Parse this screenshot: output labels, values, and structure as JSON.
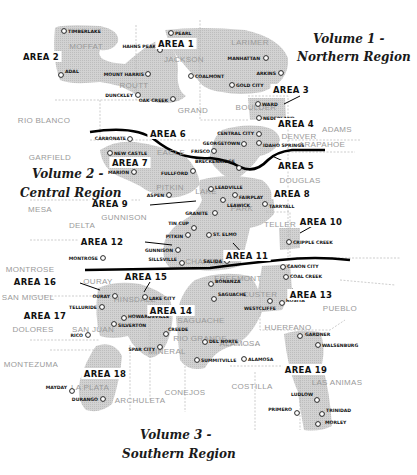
{
  "map": {
    "title": "Colorado Mining Regions",
    "volumes": [
      {
        "id": "v1",
        "line1": "Volume 1 -",
        "line2": "Northern Region",
        "x1": 313,
        "y1": 43,
        "x2": 297,
        "y2": 61,
        "anchor": "start"
      },
      {
        "id": "v2",
        "line1": "Volume 2 -",
        "line2": "Central Region",
        "x1": 32,
        "y1": 178,
        "x2": 20,
        "y2": 197,
        "anchor": "start"
      },
      {
        "id": "v3",
        "line1": "Volume 3 -",
        "line2": "Southern Region",
        "x1": 140,
        "y1": 439,
        "x2": 122,
        "y2": 458,
        "anchor": "start"
      }
    ],
    "areas": [
      {
        "id": "area-1",
        "label": "AREA 1",
        "x": 176,
        "y": 47
      },
      {
        "id": "area-2",
        "label": "AREA 2",
        "x": 41,
        "y": 60
      },
      {
        "id": "area-3",
        "label": "AREA 3",
        "x": 291,
        "y": 93
      },
      {
        "id": "area-4",
        "label": "AREA 4",
        "x": 296,
        "y": 127
      },
      {
        "id": "area-5",
        "label": "AREA 5",
        "x": 296,
        "y": 169
      },
      {
        "id": "area-6",
        "label": "AREA 6",
        "x": 168,
        "y": 137
      },
      {
        "id": "area-7",
        "label": "AREA 7",
        "x": 130,
        "y": 166
      },
      {
        "id": "area-8",
        "label": "AREA 8",
        "x": 292,
        "y": 197
      },
      {
        "id": "area-9",
        "label": "AREA 9",
        "x": 110,
        "y": 207
      },
      {
        "id": "area-10",
        "label": "AREA 10",
        "x": 321,
        "y": 225
      },
      {
        "id": "area-11",
        "label": "AREA 11",
        "x": 247,
        "y": 259
      },
      {
        "id": "area-12",
        "label": "AREA 12",
        "x": 102,
        "y": 245
      },
      {
        "id": "area-13",
        "label": "AREA 13",
        "x": 311,
        "y": 298
      },
      {
        "id": "area-14",
        "label": "AREA 14",
        "x": 171,
        "y": 314
      },
      {
        "id": "area-15",
        "label": "AREA 15",
        "x": 146,
        "y": 280
      },
      {
        "id": "area-16",
        "label": "AREA 16",
        "x": 35,
        "y": 285
      },
      {
        "id": "area-17",
        "label": "AREA 17",
        "x": 45,
        "y": 319
      },
      {
        "id": "area-18",
        "label": "AREA 18",
        "x": 105,
        "y": 377
      },
      {
        "id": "area-19",
        "label": "AREA 19",
        "x": 306,
        "y": 373
      }
    ],
    "counties": [
      {
        "name": "MOFFAT",
        "x": 86,
        "y": 49
      },
      {
        "name": "LARIMER",
        "x": 250,
        "y": 45
      },
      {
        "name": "JACKSON",
        "x": 184,
        "y": 62
      },
      {
        "name": "ROUTT",
        "x": 134,
        "y": 88
      },
      {
        "name": "GRAND",
        "x": 193,
        "y": 113
      },
      {
        "name": "RIO BLANCO",
        "x": 44,
        "y": 123
      },
      {
        "name": "BOULDER",
        "x": 256,
        "y": 110
      },
      {
        "name": "ADAMS",
        "x": 337,
        "y": 132
      },
      {
        "name": "ARAPAHOE",
        "x": 322,
        "y": 147
      },
      {
        "name": "DENVER",
        "x": 299,
        "y": 139
      },
      {
        "name": "GARFIELD",
        "x": 50,
        "y": 160
      },
      {
        "name": "EAGLE",
        "x": 171,
        "y": 155
      },
      {
        "name": "DOUGLAS",
        "x": 300,
        "y": 183
      },
      {
        "name": "PITKIN",
        "x": 170,
        "y": 190
      },
      {
        "name": "LAKE",
        "x": 206,
        "y": 194
      },
      {
        "name": "MESA",
        "x": 40,
        "y": 212
      },
      {
        "name": "PARK",
        "x": 242,
        "y": 211
      },
      {
        "name": "GUNNISON",
        "x": 124,
        "y": 220
      },
      {
        "name": "TELLER",
        "x": 280,
        "y": 227
      },
      {
        "name": "DELTA",
        "x": 82,
        "y": 228
      },
      {
        "name": "CHAFFEE",
        "x": 205,
        "y": 264
      },
      {
        "name": "MONTROSE",
        "x": 30,
        "y": 272
      },
      {
        "name": "FREEMONT",
        "x": 238,
        "y": 281
      },
      {
        "name": "SAN MIGUEL",
        "x": 28,
        "y": 300
      },
      {
        "name": "OURAY",
        "x": 98,
        "y": 284
      },
      {
        "name": "HINSDALE",
        "x": 135,
        "y": 302
      },
      {
        "name": "CUSTER",
        "x": 260,
        "y": 297
      },
      {
        "name": "PUEBLO",
        "x": 340,
        "y": 311
      },
      {
        "name": "SAGUACHE",
        "x": 201,
        "y": 323
      },
      {
        "name": "DOLORES",
        "x": 33,
        "y": 332
      },
      {
        "name": "SAN JUAN",
        "x": 93,
        "y": 332
      },
      {
        "name": "HUERFANO",
        "x": 288,
        "y": 330
      },
      {
        "name": "RIO GRANDE",
        "x": 200,
        "y": 341
      },
      {
        "name": "MINERAL",
        "x": 167,
        "y": 354
      },
      {
        "name": "ALAMOSA",
        "x": 240,
        "y": 346
      },
      {
        "name": "MONTEZUMA",
        "x": 31,
        "y": 367
      },
      {
        "name": "LA PLATA",
        "x": 90,
        "y": 390
      },
      {
        "name": "ARCHULETA",
        "x": 140,
        "y": 403
      },
      {
        "name": "CONEJOS",
        "x": 185,
        "y": 395
      },
      {
        "name": "COSTILLA",
        "x": 252,
        "y": 389
      },
      {
        "name": "LAS ANIMAS",
        "x": 337,
        "y": 385
      }
    ],
    "towns": [
      {
        "name": "TIMBERLAKE",
        "cx": 64,
        "cy": 31,
        "lx": 68,
        "ly": 33,
        "side": "right"
      },
      {
        "name": "PEARL",
        "cx": 171,
        "cy": 33,
        "lx": 175,
        "ly": 35,
        "side": "right"
      },
      {
        "name": "HAHNS PEAK",
        "cx": 160,
        "cy": 50,
        "lx": 156,
        "ly": 48,
        "side": "left"
      },
      {
        "name": "ADAL",
        "cx": 61,
        "cy": 75,
        "lx": 65,
        "ly": 73,
        "side": "right"
      },
      {
        "name": "MANHATTAN",
        "cx": 266,
        "cy": 58,
        "lx": 260,
        "ly": 60,
        "side": "left"
      },
      {
        "name": "MOUNT HARRIS",
        "cx": 148,
        "cy": 74,
        "lx": 144,
        "ly": 76,
        "side": "left"
      },
      {
        "name": "COALMONT",
        "cx": 191,
        "cy": 76,
        "lx": 195,
        "ly": 78,
        "side": "right"
      },
      {
        "name": "ARKINS",
        "cx": 281,
        "cy": 73,
        "lx": 276,
        "ly": 75,
        "side": "left"
      },
      {
        "name": "GOLD CITY",
        "cx": 232,
        "cy": 85,
        "lx": 236,
        "ly": 87,
        "side": "right"
      },
      {
        "name": "DUNCKLEY",
        "cx": 138,
        "cy": 95,
        "lx": 133,
        "ly": 97,
        "side": "left"
      },
      {
        "name": "OAK CREEK",
        "cx": 173,
        "cy": 99,
        "lx": 168,
        "ly": 102,
        "side": "left"
      },
      {
        "name": "WARD",
        "cx": 258,
        "cy": 104,
        "lx": 262,
        "ly": 106,
        "side": "right"
      },
      {
        "name": "NEDERLAND",
        "cx": 259,
        "cy": 118,
        "lx": 263,
        "ly": 120,
        "side": "right"
      },
      {
        "name": "CARBONATE",
        "cx": 130,
        "cy": 139,
        "lx": 126,
        "ly": 140,
        "side": "left"
      },
      {
        "name": "CENTRAL CITY",
        "cx": 259,
        "cy": 134,
        "lx": 254,
        "ly": 135,
        "side": "left"
      },
      {
        "name": "GEORGETOWN",
        "cx": 244,
        "cy": 144,
        "lx": 240,
        "ly": 145,
        "side": "left"
      },
      {
        "name": "IDAHO SPRINGS",
        "cx": 259,
        "cy": 143,
        "lx": 263,
        "ly": 147,
        "side": "right"
      },
      {
        "name": "FRISCO",
        "cx": 214,
        "cy": 151,
        "lx": 210,
        "ly": 153,
        "side": "left"
      },
      {
        "name": "NEW CASTLE",
        "cx": 110,
        "cy": 153,
        "lx": 114,
        "ly": 155,
        "side": "right"
      },
      {
        "name": "BRECKENRIDGE",
        "cx": 239,
        "cy": 168,
        "lx": 235,
        "ly": 163,
        "side": "left"
      },
      {
        "name": "MARION",
        "cx": 134,
        "cy": 172,
        "lx": 129,
        "ly": 174,
        "side": "left"
      },
      {
        "name": "FULLFORD",
        "cx": 193,
        "cy": 171,
        "lx": 188,
        "ly": 175,
        "side": "left"
      },
      {
        "name": "ASPEN",
        "cx": 169,
        "cy": 195,
        "lx": 164,
        "ly": 197,
        "side": "left"
      },
      {
        "name": "LEADVILLE",
        "cx": 211,
        "cy": 189,
        "lx": 215,
        "ly": 189,
        "side": "right"
      },
      {
        "name": "FAIRPLAY",
        "cx": 235,
        "cy": 195,
        "lx": 239,
        "ly": 199,
        "side": "right"
      },
      {
        "name": "LEAWICK",
        "cx": 223,
        "cy": 200,
        "lx": 227,
        "ly": 207,
        "side": "right"
      },
      {
        "name": "TARRYALL",
        "cx": 265,
        "cy": 204,
        "lx": 269,
        "ly": 208,
        "side": "right"
      },
      {
        "name": "GRANITE",
        "cx": 215,
        "cy": 213,
        "lx": 208,
        "ly": 215,
        "side": "left"
      },
      {
        "name": "TIN CUP",
        "cx": 194,
        "cy": 228,
        "lx": 189,
        "ly": 225,
        "side": "left"
      },
      {
        "name": "PITKIN",
        "cx": 188,
        "cy": 235,
        "lx": 183,
        "ly": 238,
        "side": "left"
      },
      {
        "name": "ST. ELMO",
        "cx": 209,
        "cy": 235,
        "lx": 213,
        "ly": 236,
        "side": "right"
      },
      {
        "name": "CRIPPLE CREEK",
        "cx": 289,
        "cy": 242,
        "lx": 293,
        "ly": 244,
        "side": "right"
      },
      {
        "name": "GUNNISON",
        "cx": 178,
        "cy": 250,
        "lx": 173,
        "ly": 252,
        "side": "left"
      },
      {
        "name": "MONTROSE",
        "cx": 103,
        "cy": 258,
        "lx": 98,
        "ly": 260,
        "side": "left"
      },
      {
        "name": "SILLSVILLE",
        "cx": 182,
        "cy": 263,
        "lx": 177,
        "ly": 261,
        "side": "left"
      },
      {
        "name": "SALIDA",
        "cx": 227,
        "cy": 261,
        "lx": 222,
        "ly": 263,
        "side": "left"
      },
      {
        "name": "CANON CITY",
        "cx": 283,
        "cy": 267,
        "lx": 287,
        "ly": 268,
        "side": "right"
      },
      {
        "name": "COAL CREEK",
        "cx": 286,
        "cy": 277,
        "lx": 290,
        "ly": 278,
        "side": "right"
      },
      {
        "name": "OURAY",
        "cx": 115,
        "cy": 296,
        "lx": 110,
        "ly": 298,
        "side": "left"
      },
      {
        "name": "LAKE CITY",
        "cx": 145,
        "cy": 297,
        "lx": 149,
        "ly": 300,
        "side": "right"
      },
      {
        "name": "BONANZA",
        "cx": 211,
        "cy": 284,
        "lx": 215,
        "ly": 283,
        "side": "right"
      },
      {
        "name": "SAGUACHE",
        "cx": 214,
        "cy": 299,
        "lx": 218,
        "ly": 296,
        "side": "right"
      },
      {
        "name": "WESTCLIFFE",
        "cx": 270,
        "cy": 301,
        "lx": 276,
        "ly": 310,
        "side": "left"
      },
      {
        "name": "ROSITA",
        "cx": 282,
        "cy": 303,
        "lx": 286,
        "ly": 302,
        "side": "right"
      },
      {
        "name": "TELLURIDE",
        "cx": 102,
        "cy": 307,
        "lx": 97,
        "ly": 309,
        "side": "left"
      },
      {
        "name": "HOWARDSVILLE",
        "cx": 124,
        "cy": 318,
        "lx": 128,
        "ly": 318,
        "side": "right"
      },
      {
        "name": "SILVERTON",
        "cx": 114,
        "cy": 324,
        "lx": 118,
        "ly": 327,
        "side": "right"
      },
      {
        "name": "CREEDE",
        "cx": 166,
        "cy": 334,
        "lx": 168,
        "ly": 331,
        "side": "right"
      },
      {
        "name": "RICO",
        "cx": 88,
        "cy": 335,
        "lx": 83,
        "ly": 337,
        "side": "left"
      },
      {
        "name": "GARDNER",
        "cx": 300,
        "cy": 336,
        "lx": 305,
        "ly": 336,
        "side": "right"
      },
      {
        "name": "SPAR CITY",
        "cx": 160,
        "cy": 347,
        "lx": 155,
        "ly": 351,
        "side": "left"
      },
      {
        "name": "DEL NORTE",
        "cx": 205,
        "cy": 342,
        "lx": 209,
        "ly": 343,
        "side": "right"
      },
      {
        "name": "WALSENBURG",
        "cx": 318,
        "cy": 345,
        "lx": 322,
        "ly": 347,
        "side": "right"
      },
      {
        "name": "SUMMITVILLE",
        "cx": 197,
        "cy": 360,
        "lx": 201,
        "ly": 362,
        "side": "right"
      },
      {
        "name": "ALAMOSA",
        "cx": 244,
        "cy": 359,
        "lx": 248,
        "ly": 361,
        "side": "right"
      },
      {
        "name": "MAYDAY",
        "cx": 72,
        "cy": 391,
        "lx": 67,
        "ly": 389,
        "side": "left"
      },
      {
        "name": "DURANGO",
        "cx": 103,
        "cy": 399,
        "lx": 98,
        "ly": 401,
        "side": "left"
      },
      {
        "name": "LUDLOW",
        "cx": 317,
        "cy": 400,
        "lx": 313,
        "ly": 396,
        "side": "left"
      },
      {
        "name": "PRIMERO",
        "cx": 297,
        "cy": 413,
        "lx": 292,
        "ly": 411,
        "side": "left"
      },
      {
        "name": "TRINIDAD",
        "cx": 322,
        "cy": 414,
        "lx": 326,
        "ly": 412,
        "side": "right"
      },
      {
        "name": "MORLEY",
        "cx": 318,
        "cy": 424,
        "lx": 325,
        "ly": 424,
        "side": "right"
      }
    ],
    "colors": {
      "shade": "#c9c9c9",
      "county_text": "#9a9a9a",
      "divider": "#000000"
    }
  }
}
